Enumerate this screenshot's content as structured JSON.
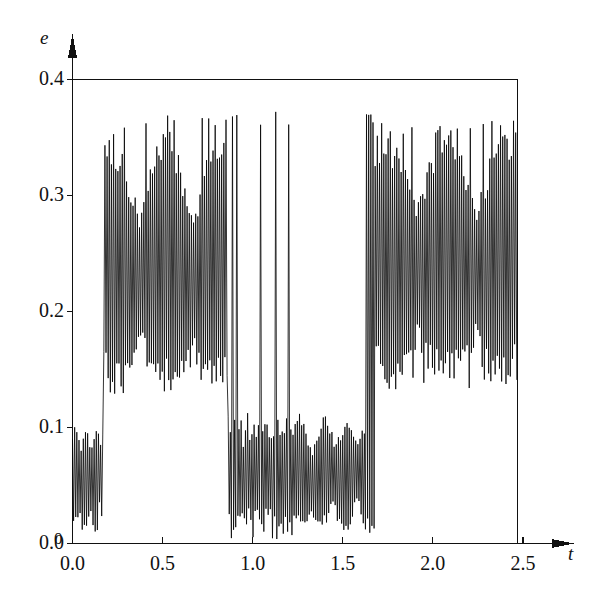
{
  "chart_data": {
    "type": "line",
    "title": "",
    "subtitle": "",
    "xlabel": "t",
    "ylabel": "e",
    "xlim": [
      0.0,
      2.5
    ],
    "ylim": [
      0.0,
      0.4
    ],
    "grid": false,
    "legend": null,
    "annotations": [],
    "xticks": [
      "0.0",
      "0.5",
      "1.0",
      "1.5",
      "2.0",
      "2.5"
    ],
    "xtick_values": [
      0.0,
      0.5,
      1.0,
      1.5,
      2.0,
      2.5
    ],
    "yticks": [
      "0.0",
      "0.1",
      "0.2",
      "0.3",
      "0.4"
    ],
    "ytick_values": [
      0.0,
      0.1,
      0.2,
      0.3,
      0.4
    ],
    "axis_origin_label": "0",
    "series": [
      {
        "name": "e(t)",
        "color": "#000000",
        "line_width": 0.8,
        "regimes": [
          {
            "t_start": 0.0,
            "t_end": 0.17,
            "band": "low",
            "lo": 0.005,
            "hi": 0.105,
            "mean": 0.055
          },
          {
            "t_start": 0.17,
            "t_end": 0.86,
            "band": "high",
            "lo": 0.14,
            "hi": 0.37,
            "mean": 0.235
          },
          {
            "t_start": 0.86,
            "t_end": 0.92,
            "band": "spike",
            "lo": 0.0,
            "hi": 0.372,
            "mean": 0.18
          },
          {
            "t_start": 0.92,
            "t_end": 1.03,
            "band": "low",
            "lo": 0.01,
            "hi": 0.11,
            "mean": 0.06
          },
          {
            "t_start": 1.03,
            "t_end": 1.22,
            "band": "spike",
            "lo": 0.0,
            "hi": 0.375,
            "mean": 0.12
          },
          {
            "t_start": 1.22,
            "t_end": 1.62,
            "band": "low",
            "lo": 0.005,
            "hi": 0.105,
            "mean": 0.058
          },
          {
            "t_start": 1.62,
            "t_end": 1.68,
            "band": "spike",
            "lo": 0.0,
            "hi": 0.37,
            "mean": 0.19
          },
          {
            "t_start": 1.68,
            "t_end": 2.46,
            "band": "high",
            "lo": 0.13,
            "hi": 0.365,
            "mean": 0.24
          },
          {
            "t_start": 2.46,
            "t_end": 2.47,
            "band": "end",
            "lo": 0.13,
            "hi": 0.16,
            "mean": 0.14
          }
        ],
        "oscillation_period": 0.012,
        "peak_max": 0.375,
        "value_min": 0.0
      }
    ]
  },
  "axes": {
    "y_axis_name": "e",
    "x_axis_name": "t",
    "origin": "0"
  }
}
